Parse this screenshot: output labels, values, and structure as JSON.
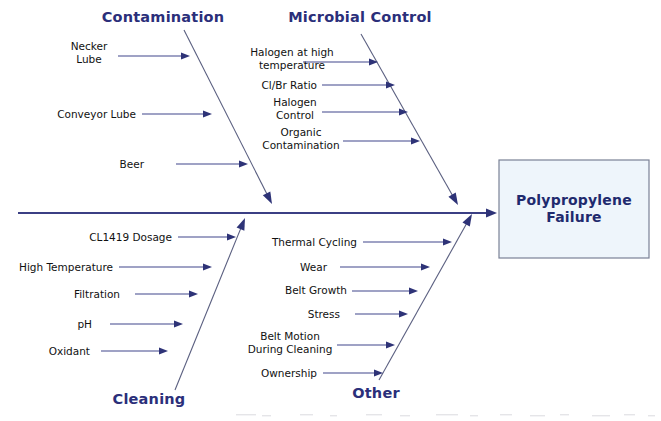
{
  "diagram": {
    "type": "fishbone-ishikawa",
    "effect": {
      "label_line1": "Polypropylene",
      "label_line2": "Failure",
      "box": {
        "x": 499,
        "y": 160,
        "width": 150,
        "height": 98
      },
      "fill_color": "#eef5fb",
      "border_color": "#7a8196",
      "text_color": "#1f2a6e"
    },
    "spine": {
      "x1": 18,
      "y1": 213,
      "x2": 497,
      "y2": 213,
      "color": "#3b3f84"
    },
    "colors": {
      "category_text": "#2b2f7a",
      "cause_text": "#111111",
      "bone_line": "#5a5f80",
      "cause_arrow": "#41468c",
      "arrowhead": "#2e3377",
      "background": "#ffffff"
    },
    "categories": [
      {
        "name": "Contamination",
        "position": "top",
        "label": {
          "x": 163,
          "y": 22,
          "anchor": "middle"
        },
        "bone": {
          "x1": 184,
          "y1": 30,
          "x2": 272,
          "y2": 204
        },
        "causes": [
          {
            "text_lines": [
              "Necker",
              "Lube"
            ],
            "text_x": 89,
            "text_y": 50,
            "anchor": "middle",
            "arrow": {
              "x1": 118,
              "y1": 56,
              "x2": 190,
              "y2": 56
            }
          },
          {
            "text_lines": [
              "Conveyor Lube"
            ],
            "text_x": 136,
            "text_y": 118,
            "anchor": "end",
            "arrow": {
              "x1": 142,
              "y1": 114,
              "x2": 212,
              "y2": 114
            }
          },
          {
            "text_lines": [
              "Beer"
            ],
            "text_x": 144,
            "text_y": 168,
            "anchor": "end",
            "arrow": {
              "x1": 176,
              "y1": 164,
              "x2": 248,
              "y2": 164
            }
          }
        ]
      },
      {
        "name": "Microbial Control",
        "position": "top",
        "label": {
          "x": 360,
          "y": 22,
          "anchor": "middle"
        },
        "bone": {
          "x1": 361,
          "y1": 34,
          "x2": 458,
          "y2": 205
        },
        "causes": [
          {
            "text_lines": [
              "Halogen at high",
              "temperature"
            ],
            "text_x": 292,
            "text_y": 56,
            "anchor": "middle",
            "arrow": {
              "x1": 303,
              "y1": 62,
              "x2": 378,
              "y2": 62
            }
          },
          {
            "text_lines": [
              "Cl/Br Ratio"
            ],
            "text_x": 317,
            "text_y": 89,
            "anchor": "end",
            "arrow": {
              "x1": 322,
              "y1": 85,
              "x2": 395,
              "y2": 85
            }
          },
          {
            "text_lines": [
              "Halogen",
              "Control"
            ],
            "text_x": 295,
            "text_y": 106,
            "anchor": "middle",
            "arrow": {
              "x1": 322,
              "y1": 112,
              "x2": 408,
              "y2": 112
            }
          },
          {
            "text_lines": [
              "Organic",
              "Contamination"
            ],
            "text_x": 301,
            "text_y": 136,
            "anchor": "middle",
            "arrow": {
              "x1": 343,
              "y1": 141,
              "x2": 420,
              "y2": 141
            }
          }
        ]
      },
      {
        "name": "Cleaning",
        "position": "bottom",
        "label": {
          "x": 149,
          "y": 404,
          "anchor": "middle"
        },
        "bone": {
          "x1": 175,
          "y1": 390,
          "x2": 245,
          "y2": 218
        },
        "causes": [
          {
            "text_lines": [
              "CL1419 Dosage"
            ],
            "text_x": 172,
            "text_y": 241,
            "anchor": "end",
            "arrow": {
              "x1": 178,
              "y1": 237,
              "x2": 236,
              "y2": 237
            }
          },
          {
            "text_lines": [
              "High Temperature"
            ],
            "text_x": 113,
            "text_y": 271,
            "anchor": "end",
            "arrow": {
              "x1": 119,
              "y1": 267,
              "x2": 212,
              "y2": 267
            }
          },
          {
            "text_lines": [
              "Filtration"
            ],
            "text_x": 120,
            "text_y": 298,
            "anchor": "end",
            "arrow": {
              "x1": 135,
              "y1": 294,
              "x2": 198,
              "y2": 294
            }
          },
          {
            "text_lines": [
              "pH"
            ],
            "text_x": 92,
            "text_y": 328,
            "anchor": "end",
            "arrow": {
              "x1": 110,
              "y1": 324,
              "x2": 183,
              "y2": 324
            }
          },
          {
            "text_lines": [
              "Oxidant"
            ],
            "text_x": 90,
            "text_y": 355,
            "anchor": "end",
            "arrow": {
              "x1": 101,
              "y1": 351,
              "x2": 168,
              "y2": 351
            }
          }
        ]
      },
      {
        "name": "Other",
        "position": "bottom",
        "label": {
          "x": 376,
          "y": 398,
          "anchor": "middle"
        },
        "bone": {
          "x1": 379,
          "y1": 380,
          "x2": 472,
          "y2": 214
        },
        "causes": [
          {
            "text_lines": [
              "Thermal Cycling"
            ],
            "text_x": 357,
            "text_y": 246,
            "anchor": "end",
            "arrow": {
              "x1": 363,
              "y1": 242,
              "x2": 452,
              "y2": 242
            }
          },
          {
            "text_lines": [
              "Wear"
            ],
            "text_x": 327,
            "text_y": 271,
            "anchor": "end",
            "arrow": {
              "x1": 340,
              "y1": 267,
              "x2": 430,
              "y2": 267
            }
          },
          {
            "text_lines": [
              "Belt Growth"
            ],
            "text_x": 347,
            "text_y": 294,
            "anchor": "end",
            "arrow": {
              "x1": 352,
              "y1": 291,
              "x2": 418,
              "y2": 291
            }
          },
          {
            "text_lines": [
              "Stress"
            ],
            "text_x": 340,
            "text_y": 318,
            "anchor": "end",
            "arrow": {
              "x1": 355,
              "y1": 314,
              "x2": 408,
              "y2": 314
            }
          },
          {
            "text_lines": [
              "Belt Motion",
              "During Cleaning"
            ],
            "text_x": 290,
            "text_y": 340,
            "anchor": "middle",
            "arrow": {
              "x1": 337,
              "y1": 345,
              "x2": 395,
              "y2": 345
            }
          },
          {
            "text_lines": [
              "Ownership"
            ],
            "text_x": 317,
            "text_y": 377,
            "anchor": "end",
            "arrow": {
              "x1": 323,
              "y1": 373,
              "x2": 383,
              "y2": 373
            }
          }
        ]
      }
    ]
  }
}
